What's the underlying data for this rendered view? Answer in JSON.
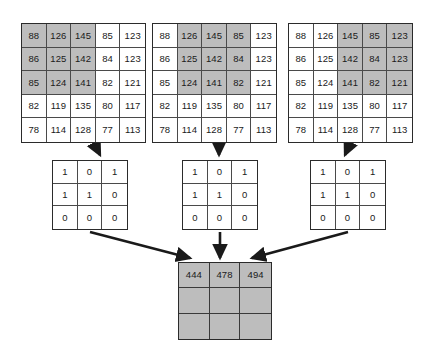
{
  "diagram": {
    "colors": {
      "shade": "#bdbdbd",
      "line": "#2b2b2b",
      "cell_border": "#4a4a4a",
      "background": "#ffffff",
      "text": "#1a1a1a"
    }
  },
  "input_matrices": [
    {
      "name": "input-matrix-window-1",
      "rows": [
        [
          "88",
          "126",
          "145",
          "85",
          "123"
        ],
        [
          "86",
          "125",
          "142",
          "84",
          "123"
        ],
        [
          "85",
          "124",
          "141",
          "82",
          "121"
        ],
        [
          "82",
          "119",
          "135",
          "80",
          "117"
        ],
        [
          "78",
          "114",
          "128",
          "77",
          "113"
        ]
      ],
      "shaded_rows": [
        0,
        1,
        2
      ],
      "shaded_cols": [
        0,
        1,
        2
      ]
    },
    {
      "name": "input-matrix-window-2",
      "rows": [
        [
          "88",
          "126",
          "145",
          "85",
          "123"
        ],
        [
          "86",
          "125",
          "142",
          "84",
          "123"
        ],
        [
          "85",
          "124",
          "141",
          "82",
          "121"
        ],
        [
          "82",
          "119",
          "135",
          "80",
          "117"
        ],
        [
          "78",
          "114",
          "128",
          "77",
          "113"
        ]
      ],
      "shaded_rows": [
        0,
        1,
        2
      ],
      "shaded_cols": [
        1,
        2,
        3
      ]
    },
    {
      "name": "input-matrix-window-3",
      "rows": [
        [
          "88",
          "126",
          "145",
          "85",
          "123"
        ],
        [
          "86",
          "125",
          "142",
          "84",
          "123"
        ],
        [
          "85",
          "124",
          "141",
          "82",
          "121"
        ],
        [
          "82",
          "119",
          "135",
          "80",
          "117"
        ],
        [
          "78",
          "114",
          "128",
          "77",
          "113"
        ]
      ],
      "shaded_rows": [
        0,
        1,
        2
      ],
      "shaded_cols": [
        2,
        3,
        4
      ]
    }
  ],
  "kernels": [
    {
      "name": "kernel-1",
      "rows": [
        [
          "1",
          "0",
          "1"
        ],
        [
          "1",
          "1",
          "0"
        ],
        [
          "0",
          "0",
          "0"
        ]
      ]
    },
    {
      "name": "kernel-2",
      "rows": [
        [
          "1",
          "0",
          "1"
        ],
        [
          "1",
          "1",
          "0"
        ],
        [
          "0",
          "0",
          "0"
        ]
      ]
    },
    {
      "name": "kernel-3",
      "rows": [
        [
          "1",
          "0",
          "1"
        ],
        [
          "1",
          "1",
          "0"
        ],
        [
          "0",
          "0",
          "0"
        ]
      ]
    }
  ],
  "output_matrix": {
    "name": "output-feature-map",
    "rows": [
      [
        "444",
        "478",
        "494"
      ],
      [
        "",
        "",
        ""
      ],
      [
        "",
        "",
        ""
      ]
    ]
  }
}
